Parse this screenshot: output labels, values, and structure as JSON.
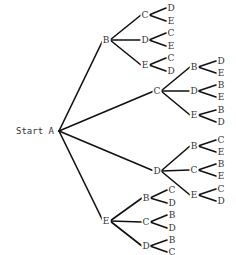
{
  "diagram": {
    "type": "tree",
    "start_label": "Start A",
    "line_color": "#111111",
    "root": {
      "label": "A",
      "x": 59,
      "y": 131
    },
    "branches": [
      {
        "label": "B",
        "x": 106,
        "y": 40,
        "children": [
          {
            "label": "C",
            "x": 145,
            "y": 15,
            "leaves": [
              {
                "label": "D",
                "x": 171,
                "y": 8
              },
              {
                "label": "E",
                "x": 171,
                "y": 21
              }
            ]
          },
          {
            "label": "D",
            "x": 145,
            "y": 40,
            "leaves": [
              {
                "label": "C",
                "x": 171,
                "y": 33
              },
              {
                "label": "E",
                "x": 171,
                "y": 46
              }
            ]
          },
          {
            "label": "E",
            "x": 145,
            "y": 65,
            "leaves": [
              {
                "label": "C",
                "x": 171,
                "y": 58
              },
              {
                "label": "D",
                "x": 171,
                "y": 71
              }
            ]
          }
        ]
      },
      {
        "label": "C",
        "x": 157,
        "y": 91,
        "children": [
          {
            "label": "B",
            "x": 194,
            "y": 67,
            "leaves": [
              {
                "label": "D",
                "x": 221,
                "y": 61
              },
              {
                "label": "E",
                "x": 221,
                "y": 73
              }
            ]
          },
          {
            "label": "D",
            "x": 194,
            "y": 91,
            "leaves": [
              {
                "label": "B",
                "x": 221,
                "y": 85
              },
              {
                "label": "E",
                "x": 221,
                "y": 97
              }
            ]
          },
          {
            "label": "E",
            "x": 194,
            "y": 115,
            "leaves": [
              {
                "label": "B",
                "x": 221,
                "y": 110
              },
              {
                "label": "D",
                "x": 221,
                "y": 122
              }
            ]
          }
        ]
      },
      {
        "label": "D",
        "x": 157,
        "y": 171,
        "children": [
          {
            "label": "B",
            "x": 194,
            "y": 146,
            "leaves": [
              {
                "label": "C",
                "x": 221,
                "y": 140
              },
              {
                "label": "E",
                "x": 221,
                "y": 152
              }
            ]
          },
          {
            "label": "C",
            "x": 194,
            "y": 170,
            "leaves": [
              {
                "label": "B",
                "x": 221,
                "y": 164
              },
              {
                "label": "E",
                "x": 221,
                "y": 176
              }
            ]
          },
          {
            "label": "E",
            "x": 194,
            "y": 195,
            "leaves": [
              {
                "label": "C",
                "x": 221,
                "y": 189
              },
              {
                "label": "D",
                "x": 221,
                "y": 201
              }
            ]
          }
        ]
      },
      {
        "label": "E",
        "x": 106,
        "y": 221,
        "children": [
          {
            "label": "B",
            "x": 146,
            "y": 198,
            "leaves": [
              {
                "label": "C",
                "x": 172,
                "y": 190
              },
              {
                "label": "D",
                "x": 172,
                "y": 203
              }
            ]
          },
          {
            "label": "C",
            "x": 146,
            "y": 222,
            "leaves": [
              {
                "label": "B",
                "x": 172,
                "y": 215
              },
              {
                "label": "D",
                "x": 172,
                "y": 228
              }
            ]
          },
          {
            "label": "D",
            "x": 146,
            "y": 246,
            "leaves": [
              {
                "label": "B",
                "x": 172,
                "y": 240
              },
              {
                "label": "C",
                "x": 172,
                "y": 252
              }
            ]
          }
        ]
      }
    ]
  }
}
